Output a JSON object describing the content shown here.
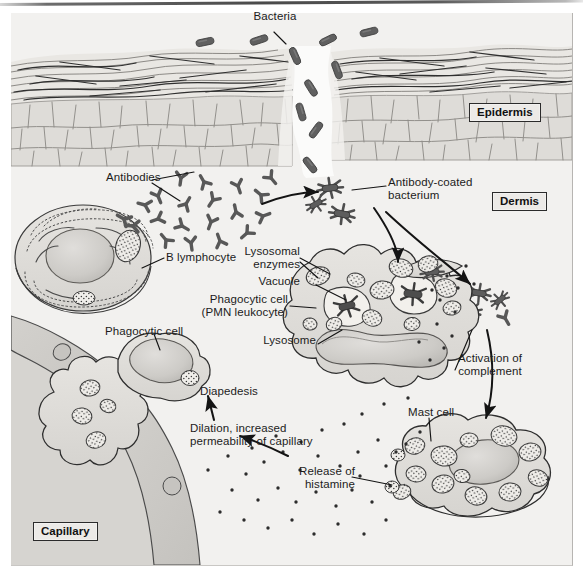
{
  "figure": {
    "domain": "biology-illustration",
    "background_color": "#f2f1ef",
    "ink_color": "#1c1c1c",
    "cell_fill": "#dedcd8",
    "bacteria_color": "#5a5a5a",
    "antibody_color": "#585858"
  },
  "region_labels": [
    {
      "id": "epidermis",
      "text": "Epidermis",
      "boxed": true,
      "x": 469,
      "y": 103
    },
    {
      "id": "dermis",
      "text": "Dermis",
      "boxed": true,
      "x": 492,
      "y": 192
    },
    {
      "id": "capillary",
      "text": "Capillary",
      "boxed": true,
      "x": 33,
      "y": 522
    }
  ],
  "callout_labels": [
    {
      "id": "bacteria",
      "text": "Bacteria",
      "x": 275,
      "y": 16,
      "align": "center"
    },
    {
      "id": "antibodies",
      "text": "Antibodies",
      "x": 106,
      "y": 177,
      "align": "left"
    },
    {
      "id": "antibody-coated-bacterium",
      "text": "Antibody-coated\nbacterium",
      "x": 388,
      "y": 182,
      "align": "left"
    },
    {
      "id": "b-lymphocyte",
      "text": "B lymphocyte",
      "x": 166,
      "y": 256,
      "align": "left"
    },
    {
      "id": "lysosomal-enzymes",
      "text": "Lysosomal\nenzymes",
      "x": 263,
      "y": 251,
      "align": "left"
    },
    {
      "id": "vacuole",
      "text": "Vacuole",
      "x": 279,
      "y": 281,
      "align": "left"
    },
    {
      "id": "phagocytic-cell-pmn",
      "text": "Phagocytic cell\n(PMN leukocyte)",
      "x": 206,
      "y": 299,
      "align": "left"
    },
    {
      "id": "lysosome",
      "text": "Lysosome",
      "x": 270,
      "y": 340,
      "align": "left"
    },
    {
      "id": "phagocytic-cell",
      "text": "Phagocytic cell",
      "x": 105,
      "y": 330,
      "align": "left"
    },
    {
      "id": "activation-of-complement",
      "text": "Activation of\ncomplement",
      "x": 458,
      "y": 358,
      "align": "left"
    },
    {
      "id": "diapedesis",
      "text": "Diapedesis",
      "x": 200,
      "y": 390,
      "align": "left"
    },
    {
      "id": "dilation-permeability",
      "text": "Dilation, increased\npermeability of capillary",
      "x": 190,
      "y": 428,
      "align": "left"
    },
    {
      "id": "mast-cell",
      "text": "Mast cell",
      "x": 408,
      "y": 411,
      "align": "left"
    },
    {
      "id": "release-of-histamine",
      "text": "Release of\nhistamine",
      "x": 293,
      "y": 471,
      "align": "left"
    }
  ],
  "structures": [
    {
      "id": "stratum-corneum",
      "name": "Stratum corneum flattened keratin layers"
    },
    {
      "id": "epidermal-cells",
      "name": "Cobblestone epidermal cell layer"
    },
    {
      "id": "wound-gap",
      "name": "Break in the epidermis through which bacteria enter"
    },
    {
      "id": "b-lymphocyte-cell",
      "name": "B lymphocyte with rough endoplasmic reticulum and nucleus"
    },
    {
      "id": "pmn-leukocyte-cell",
      "name": "PMN leukocyte with multilobed nucleus, granules and phagosomes"
    },
    {
      "id": "phagocytic-cell-migrating",
      "name": "Phagocytic cell squeezing through capillary wall"
    },
    {
      "id": "mast-cell-body",
      "name": "Mast cell with histamine granules"
    },
    {
      "id": "capillary-wall",
      "name": "Capillary endothelium with nuclei"
    },
    {
      "id": "histamine-particles",
      "name": "Scattered histamine granule dots"
    },
    {
      "id": "complement-cluster",
      "name": "Cluster of antibody-coated bacteria activating complement"
    }
  ],
  "counts": {
    "bacteria_rods": 11,
    "free_antibodies": 18,
    "coated_bacteria": 3,
    "mast_cell_granules": 13
  }
}
